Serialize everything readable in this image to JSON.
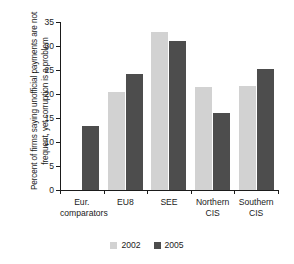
{
  "chart_data": {
    "type": "bar",
    "title": "",
    "xlabel": "",
    "ylabel": "Percent of firms saying unofficial payments are not frequent, yet corruption is a problem",
    "categories": [
      "Eur. comparators",
      "EU8",
      "SEE",
      "Northern CIS",
      "Southern CIS"
    ],
    "category_lines": [
      [
        "Eur.",
        "comparators"
      ],
      [
        "EU8"
      ],
      [
        "SEE"
      ],
      [
        "Northern",
        "CIS"
      ],
      [
        "Southern",
        "CIS"
      ]
    ],
    "series": [
      {
        "name": "2002",
        "color": "#d2d2d2",
        "values": [
          null,
          20.4,
          33.0,
          21.5,
          21.7
        ]
      },
      {
        "name": "2005",
        "color": "#4d4d4d",
        "values": [
          13.4,
          24.2,
          31.1,
          16.0,
          25.2
        ]
      }
    ],
    "ylim": [
      0,
      35
    ],
    "ytick_values": [
      0,
      5,
      10,
      15,
      20,
      25,
      30,
      35
    ],
    "ytick_labels": [
      "0",
      "5",
      "10",
      "15",
      "20",
      "25",
      "30",
      "35"
    ],
    "grid": false,
    "legend_position": "bottom"
  },
  "legend": {
    "items": [
      {
        "label": "2002",
        "color": "#d2d2d2"
      },
      {
        "label": "2005",
        "color": "#4d4d4d"
      }
    ]
  },
  "colors": {
    "axis": "#1b1b1b",
    "text": "#1b1b1b",
    "background": "#ffffff",
    "series_2002": "#d2d2d2",
    "series_2005": "#4d4d4d"
  }
}
